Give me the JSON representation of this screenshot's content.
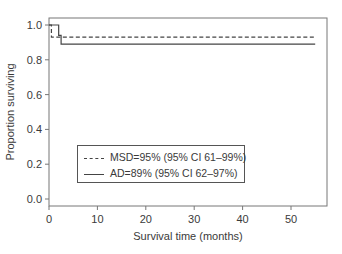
{
  "chart_data": {
    "type": "line",
    "subtype": "kaplan-meier-step",
    "title": "",
    "xlabel": "Survival time (months)",
    "ylabel": "Proportion surviving",
    "xlim": [
      0,
      57
    ],
    "ylim": [
      -0.03,
      1.03
    ],
    "x_ticks": [
      0,
      10,
      20,
      30,
      40,
      50
    ],
    "y_ticks": [
      0.0,
      0.2,
      0.4,
      0.6,
      0.8,
      1.0
    ],
    "x_tick_labels": [
      "0",
      "10",
      "20",
      "30",
      "40",
      "50"
    ],
    "y_tick_labels": [
      "0.0",
      "0.2",
      "0.4",
      "0.6",
      "0.8",
      "1.0"
    ],
    "grid": false,
    "legend_position": "lower-left inside",
    "series": [
      {
        "name": "MSD",
        "label": "MSD=95% (95% CI 61–99%)",
        "line_style": "dashed",
        "color": "#444444",
        "x": [
          0,
          0.5,
          0.5,
          55
        ],
        "y": [
          1.0,
          1.0,
          0.93,
          0.93
        ]
      },
      {
        "name": "AD",
        "label": "AD=89% (95% CI 62–97%)",
        "line_style": "solid",
        "color": "#444444",
        "x": [
          0,
          2,
          2,
          2.5,
          2.5,
          55
        ],
        "y": [
          1.0,
          1.0,
          0.94,
          0.94,
          0.89,
          0.89
        ]
      }
    ]
  },
  "legend": {
    "items": [
      {
        "label": "MSD=95% (95% CI 61–99%)",
        "style": "dashed"
      },
      {
        "label": "AD=89% (95% CI 62–97%)",
        "style": "solid"
      }
    ]
  },
  "axes": {
    "x_title": "Survival time (months)",
    "y_title": "Proportion surviving",
    "x_ticks": [
      "0",
      "10",
      "20",
      "30",
      "40",
      "50"
    ],
    "y_ticks": [
      "0.0",
      "0.2",
      "0.4",
      "0.6",
      "0.8",
      "1.0"
    ]
  }
}
